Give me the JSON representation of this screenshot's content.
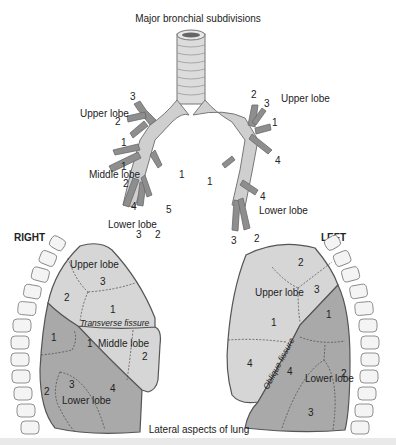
{
  "title": "Major bronchial subdivisions",
  "caption": "Lateral aspects of lung",
  "colors": {
    "bronchus": "#8e8e8e",
    "trachea": "#d8d8d8",
    "lung_light": "#d6d6d6",
    "lung_dark": "#a9a9a9",
    "outline": "#555555",
    "vertebra": "#f4f4f4"
  },
  "bronchi": {
    "right": {
      "upper": {
        "label": "Upper lobe",
        "segments": [
          "3",
          "2",
          "1"
        ]
      },
      "middle": {
        "label": "Middle lobe",
        "segments": [
          "1",
          "2"
        ]
      },
      "lower": {
        "label": "Lower lobe",
        "segments": [
          "1",
          "4",
          "5",
          "3",
          "2"
        ]
      }
    },
    "left": {
      "upper": {
        "label": "Upper lobe",
        "segments": [
          "2",
          "3",
          "1",
          "4"
        ]
      },
      "lower": {
        "label": "Lower lobe",
        "segments": [
          "1",
          "4",
          "2",
          "3"
        ]
      }
    }
  },
  "lungs": {
    "right": {
      "heading": "RIGHT",
      "upper_lobe": {
        "label": "Upper lobe",
        "segments": [
          "3",
          "2",
          "1"
        ]
      },
      "fissure": "Transverse fissure",
      "middle_lobe": {
        "label": "Middle lobe",
        "segments": [
          "1",
          "2"
        ]
      },
      "lower_lobe": {
        "label": "Lower lobe",
        "segments": [
          "1",
          "2",
          "3",
          "4"
        ]
      }
    },
    "left": {
      "heading": "LEFT",
      "upper_lobe": {
        "label": "Upper lobe",
        "segments": [
          "2",
          "3",
          "1",
          "4"
        ]
      },
      "fissure": "Oblique fissure",
      "lower_lobe": {
        "label": "Lower lobe",
        "segments": [
          "1",
          "4",
          "2",
          "3"
        ]
      }
    }
  }
}
